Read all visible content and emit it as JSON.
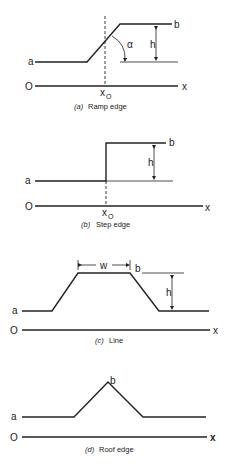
{
  "panels": [
    {
      "id": "a",
      "caption_letter": "(a)",
      "caption_text": "Ramp edge",
      "labels": {
        "low": "a",
        "high": "b",
        "height": "h",
        "angle": "α",
        "origin": "O",
        "axis": "x",
        "x0": "x",
        "x0_sub": "O"
      }
    },
    {
      "id": "b",
      "caption_letter": "(b)",
      "caption_text": "Step edge",
      "labels": {
        "low": "a",
        "high": "b",
        "height": "h",
        "origin": "O",
        "axis": "x",
        "x0": "x",
        "x0_sub": "O"
      }
    },
    {
      "id": "c",
      "caption_letter": "(c)",
      "caption_text": "Line",
      "labels": {
        "low": "a",
        "high": "b",
        "height": "h",
        "width": "w",
        "origin": "O",
        "axis": "x"
      }
    },
    {
      "id": "d",
      "caption_letter": "(d)",
      "caption_text": "Roof edge",
      "labels": {
        "low": "a",
        "peak": "b",
        "origin": "O",
        "axis": "x"
      }
    }
  ],
  "colors": {
    "ink": "#222222",
    "background": "#ffffff"
  }
}
